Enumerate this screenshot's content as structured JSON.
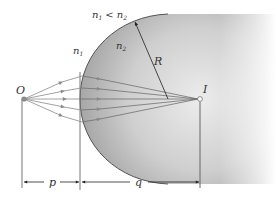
{
  "diagram": {
    "type": "refraction at spherical surface",
    "labels": {
      "condition_n1": "n",
      "condition_n1_sub": "1",
      "condition_lt": "<",
      "condition_n2": "n",
      "condition_n2_sub": "2",
      "medium1": "n",
      "medium1_sub": "1",
      "medium2": "n",
      "medium2_sub": "2",
      "radius": "R",
      "object": "O",
      "image": "I",
      "object_distance": "p",
      "image_distance": "q"
    },
    "colors": {
      "ray": "#8a8a8a",
      "surface_edge": "#555555",
      "shade_dark": "#a8a8a8",
      "shade_light": "#f4f4f4",
      "text": "#333333",
      "arrow": "#222222"
    },
    "ray_count": 5
  }
}
